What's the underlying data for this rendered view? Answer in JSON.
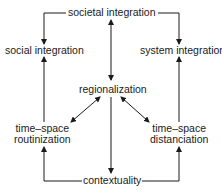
{
  "diagram": {
    "nodes": {
      "societal": "societal integration",
      "social": "social integration",
      "system": "system integration",
      "regionalization": "regionalization",
      "routinization_1": "time–space",
      "routinization_2": "routinization",
      "distanciation_1": "time–space",
      "distanciation_2": "distanciation",
      "contextuality": "contextuality"
    },
    "edges": [
      {
        "from": "societal integration",
        "to": "social integration",
        "type": "arrow"
      },
      {
        "from": "societal integration",
        "to": "system integration",
        "type": "arrow"
      },
      {
        "from": "societal integration",
        "to": "regionalization",
        "type": "double-arrow"
      },
      {
        "from": "regionalization",
        "to": "time-space routinization",
        "type": "double-arrow"
      },
      {
        "from": "regionalization",
        "to": "time-space distanciation",
        "type": "double-arrow"
      },
      {
        "from": "regionalization",
        "to": "contextuality",
        "type": "arrow"
      },
      {
        "from": "contextuality",
        "to": "time-space routinization",
        "type": "arrow"
      },
      {
        "from": "contextuality",
        "to": "time-space distanciation",
        "type": "arrow"
      },
      {
        "from": "time-space routinization",
        "to": "social integration",
        "type": "arrow"
      },
      {
        "from": "time-space distanciation",
        "to": "system integration",
        "type": "arrow"
      }
    ],
    "colors": {
      "line": "#1a1a1a",
      "background": "#ffffff"
    }
  }
}
